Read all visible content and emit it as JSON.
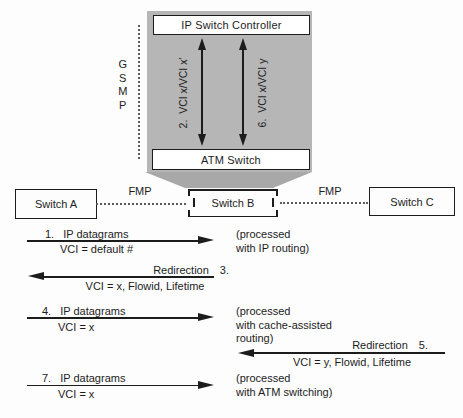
{
  "palette": {
    "box_gray": "#b6b6b6",
    "funnel_gray": "#a8a8a8",
    "ink": "#1c1c1c"
  },
  "controller": {
    "title": "IP Switch Controller",
    "atm": "ATM Switch",
    "protocol_letters": [
      "G",
      "S",
      "M",
      "P"
    ],
    "left_arrow_label": "2.  VCI x/VCI x'",
    "right_arrow_label": "6.  VCI x/VCI y"
  },
  "switch_row": {
    "switch_a": "Switch A",
    "switch_b": "Switch B",
    "switch_c": "Switch C",
    "fmp_left": "FMP",
    "fmp_right": "FMP"
  },
  "messages": [
    {
      "num": "1.",
      "title": "IP datagrams",
      "detail": "VCI = default #",
      "note": "(processed\nwith IP routing)"
    },
    {
      "num": "3.",
      "title": "Redirection",
      "detail": "VCI = x, Flowid, Lifetime",
      "note": ""
    },
    {
      "num": "4.",
      "title": "IP datagrams",
      "detail": "VCI = x",
      "note": "(processed\nwith cache-assisted\nrouting)"
    },
    {
      "num": "5.",
      "title": "Redirection",
      "detail": "VCI = y, Flowid, Lifetime",
      "note": ""
    },
    {
      "num": "7.",
      "title": "IP datagrams",
      "detail": "VCI = x",
      "note": "(processed\nwith ATM switching)"
    }
  ]
}
